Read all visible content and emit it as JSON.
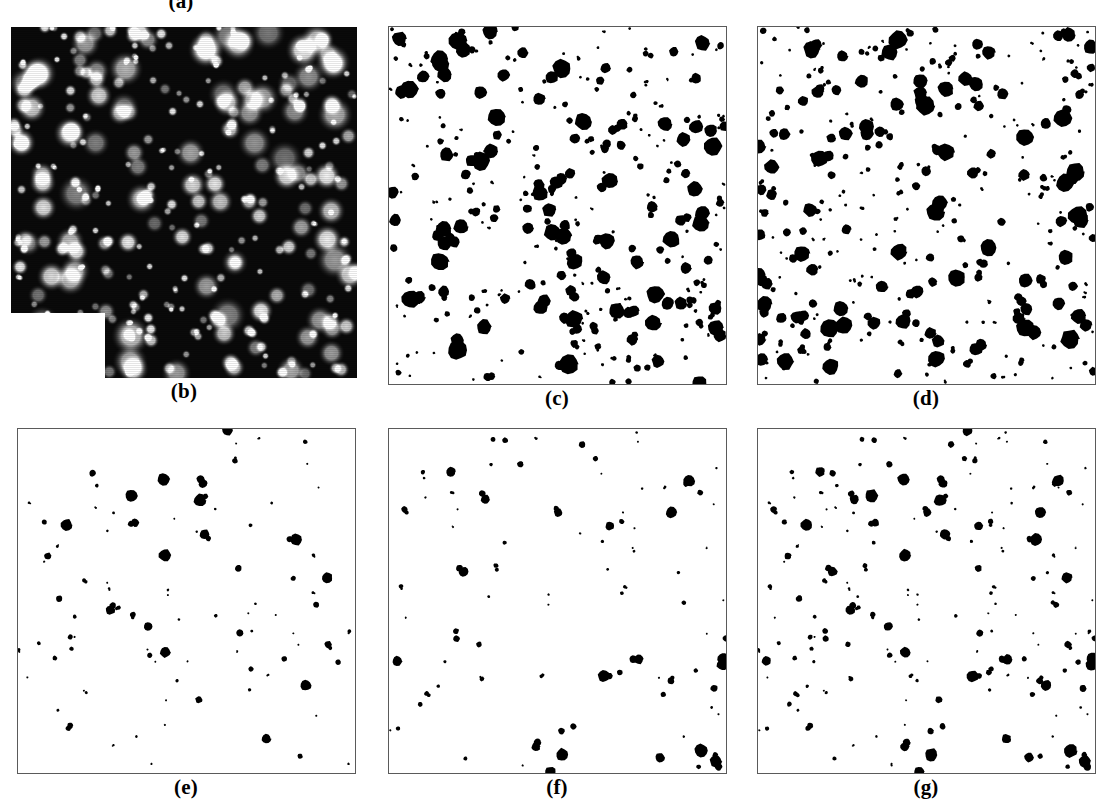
{
  "figure": {
    "type": "multi-panel-micrograph-figure",
    "width": 1107,
    "height": 810,
    "background_color": "#ffffff",
    "rows": 2,
    "columns": 3,
    "panel_count": 6,
    "visible_panel_labels": [
      "(a)",
      "(b)",
      "(c)",
      "(d)",
      "(e)",
      "(f)",
      "(g)"
    ]
  },
  "colors": {
    "page_background": "#ffffff",
    "panel_border": "#5a5a5a",
    "blob_fill": "#000000",
    "micrograph_background": "#0a0a0a",
    "micrograph_particle": "#f2f2f2",
    "caption_text": "#000000",
    "notch_fill": "#ffffff"
  },
  "captions": {
    "a": "(a)",
    "b": "(b)",
    "c": "(c)",
    "d": "(d)",
    "e": "(e)",
    "f": "(f)",
    "g": "(g)"
  },
  "panels": [
    {
      "id": "a",
      "label": "(a)",
      "kind": "label-only",
      "note": "label clipped at top edge of image; its panel is not visible",
      "label_x": 181,
      "label_y": -9,
      "x": 0,
      "y": 0,
      "w": 0,
      "h": 0
    },
    {
      "id": "b",
      "label": "(b)",
      "kind": "grayscale-micrograph",
      "description": "bright rounded particles on dark background, white rectangular notch at lower-left",
      "x": 11,
      "y": 27,
      "w": 346,
      "h": 351,
      "label_x": 184,
      "label_y": 381,
      "notch": {
        "x": 11,
        "y": 313,
        "w": 94,
        "h": 65
      }
    },
    {
      "id": "c",
      "label": "(c)",
      "kind": "binary-segmentation",
      "description": "dense black blobs on white background",
      "density": "high",
      "blob_count": 320,
      "x": 388,
      "y": 26,
      "w": 339,
      "h": 359,
      "label_x": 557,
      "label_y": 388
    },
    {
      "id": "d",
      "label": "(d)",
      "kind": "binary-segmentation",
      "description": "dense black blobs on white background",
      "density": "high",
      "blob_count": 330,
      "x": 757,
      "y": 26,
      "w": 339,
      "h": 359,
      "label_x": 926,
      "label_y": 388
    },
    {
      "id": "e",
      "label": "(e)",
      "kind": "binary-segmentation",
      "description": "sparse black blobs on white background",
      "density": "low",
      "blob_count": 95,
      "x": 17,
      "y": 428,
      "w": 339,
      "h": 346,
      "label_x": 186,
      "label_y": 777
    },
    {
      "id": "f",
      "label": "(f)",
      "kind": "binary-segmentation",
      "description": "sparse black blobs on white background",
      "density": "low",
      "blob_count": 92,
      "x": 388,
      "y": 428,
      "w": 339,
      "h": 346,
      "label_x": 557,
      "label_y": 777
    },
    {
      "id": "g",
      "label": "(g)",
      "kind": "binary-segmentation",
      "description": "medium density black blobs on white background; visually the union of panels (e) and (f)",
      "density": "medium",
      "blob_count": 180,
      "x": 757,
      "y": 428,
      "w": 339,
      "h": 346,
      "label_x": 926,
      "label_y": 777
    }
  ],
  "chart_data": {
    "type": "scatter",
    "title": "",
    "xlabel": "",
    "ylabel": "",
    "note": "Panels show particle fields. Coordinates are normalized 0-1 within each panel; r is the blob radius in normalized panel units.",
    "panel_series": [
      {
        "panel": "b",
        "name": "grayscale micrograph particles",
        "rendering": "blurred bright gaussian spots on near-black background",
        "seed": 1301,
        "count": 300,
        "radius_range": [
          0.006,
          0.03
        ]
      },
      {
        "panel": "c",
        "name": "dense binary blobs",
        "seed": 7,
        "count": 320,
        "radius_range": [
          0.004,
          0.028
        ]
      },
      {
        "panel": "d",
        "name": "dense binary blobs",
        "seed": 23,
        "count": 330,
        "radius_range": [
          0.004,
          0.028
        ]
      },
      {
        "panel": "e",
        "name": "sparse binary blobs",
        "seed": 101,
        "count": 95,
        "radius_range": [
          0.003,
          0.02
        ]
      },
      {
        "panel": "f",
        "name": "sparse binary blobs",
        "seed": 202,
        "count": 92,
        "radius_range": [
          0.003,
          0.02
        ]
      },
      {
        "panel": "g",
        "name": "union of (e) and (f)",
        "seeds": [
          101,
          202
        ],
        "count": 187,
        "radius_range": [
          0.003,
          0.02
        ]
      }
    ]
  }
}
